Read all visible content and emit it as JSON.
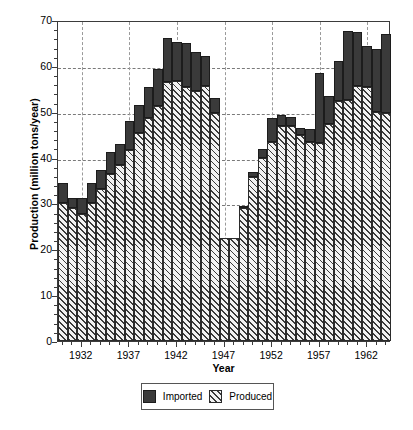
{
  "chart_data": {
    "type": "bar",
    "stacked": true,
    "title": "",
    "xlabel": "Year",
    "ylabel": "Production (million tons/year)",
    "ylim": [
      0,
      70
    ],
    "ytick_values": [
      0,
      10,
      20,
      30,
      40,
      50,
      60,
      70
    ],
    "ytick_labels": [
      "0",
      "10",
      "20",
      "30",
      "40",
      "50",
      "60",
      "70"
    ],
    "yminor_step": 2,
    "grid": "both-dashed",
    "legend_position": "below-axes-center",
    "xlim": [
      1929.5,
      1964.5
    ],
    "xtick_values": [
      1932,
      1937,
      1942,
      1947,
      1952,
      1957,
      1962
    ],
    "xtick_labels": [
      "1932",
      "1937",
      "1942",
      "1947",
      "1952",
      "1957",
      "1962"
    ],
    "categories": [
      1930,
      1931,
      1932,
      1933,
      1934,
      1935,
      1936,
      1937,
      1938,
      1939,
      1940,
      1941,
      1942,
      1943,
      1944,
      1945,
      1946,
      1947,
      1948,
      1949,
      1950,
      1951,
      1952,
      1953,
      1954,
      1955,
      1956,
      1957,
      1958,
      1959,
      1960,
      1961,
      1962,
      1963,
      1964
    ],
    "series": [
      {
        "name": "Produced",
        "color": "#f2f2f2",
        "hatch": "///",
        "values": [
          30.2,
          28.9,
          27.8,
          30.2,
          33.1,
          36.4,
          38.3,
          41.7,
          45.4,
          48.6,
          51.2,
          56.5,
          56.7,
          55.3,
          54.6,
          55.7,
          49.8,
          22.5,
          22.4,
          29.0,
          35.8,
          40.0,
          43.4,
          46.9,
          46.8,
          45.0,
          43.3,
          43.1,
          47.4,
          52.3,
          52.5,
          55.7,
          55.3,
          50.0,
          49.8
        ]
      },
      {
        "name": "Imported",
        "color": "#3a3a3a",
        "hatch": "",
        "values": [
          4.2,
          2.2,
          3.3,
          4.2,
          4.2,
          4.8,
          4.7,
          6.3,
          6.1,
          6.7,
          8.2,
          9.6,
          8.6,
          9.7,
          8.5,
          6.5,
          3.2,
          0.0,
          0.0,
          0.3,
          1.1,
          1.8,
          5.3,
          2.4,
          2.0,
          1.5,
          2.9,
          15.4,
          6.0,
          8.8,
          15.2,
          11.7,
          9.1,
          13.6,
          17.2
        ]
      }
    ],
    "totals": [
      34.4,
      31.1,
      31.1,
      34.4,
      37.3,
      41.2,
      43.0,
      48.0,
      51.5,
      55.3,
      59.4,
      66.1,
      65.3,
      65.0,
      63.1,
      62.2,
      53.0,
      22.5,
      22.4,
      29.3,
      36.9,
      41.8,
      48.7,
      49.3,
      48.8,
      46.5,
      46.2,
      58.5,
      53.4,
      61.1,
      67.7,
      67.4,
      64.4,
      63.6,
      67.0
    ]
  },
  "legend": {
    "items": [
      {
        "label": "Imported",
        "swatch": "solid-dark-square"
      },
      {
        "label": "Produced",
        "swatch": "hatched-square"
      }
    ]
  }
}
